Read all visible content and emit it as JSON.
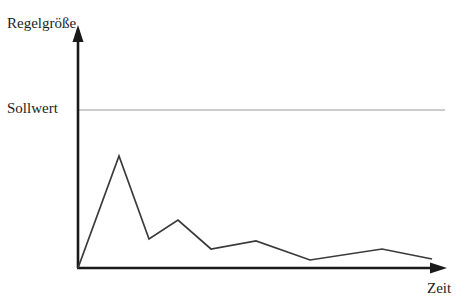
{
  "figure": {
    "title": "",
    "axis_label_y": "Regelgröße",
    "axis_label_x": "Zeit",
    "setpoint_label": "Sollwert",
    "colors": {
      "background": "#ffffff",
      "axis": "#1a1a1a",
      "curve": "#3a3a3a",
      "setpoint_line": "#9a9a9a",
      "text": "#1d1d1d"
    }
  },
  "chart_data": {
    "type": "line",
    "title": "",
    "xlabel": "Zeit",
    "ylabel": "Regelgröße",
    "grid": false,
    "legend": null,
    "axes": {
      "x_arrow": true,
      "y_arrow": true,
      "x_ticks": [],
      "y_ticks": [
        "Sollwert"
      ],
      "origin_px": [
        78,
        268
      ],
      "x_axis_end_px": [
        446,
        268
      ],
      "y_axis_top_px": [
        78,
        27
      ]
    },
    "annotations": [
      {
        "name": "setpoint",
        "label": "Sollwert",
        "type": "horizontal-line",
        "y_px": 110,
        "x_start_px": 78,
        "x_end_px": 445,
        "color": "#9a9a9a"
      }
    ],
    "series": [
      {
        "name": "Regelgröße",
        "color": "#3a3a3a",
        "points_px": [
          [
            78,
            268
          ],
          [
            119,
            156
          ],
          [
            149,
            239
          ],
          [
            178,
            220
          ],
          [
            211,
            249
          ],
          [
            256,
            241
          ],
          [
            310,
            260
          ],
          [
            382,
            249
          ],
          [
            432,
            259
          ]
        ],
        "x": [
          0,
          1,
          2,
          3,
          4,
          5,
          6,
          7,
          8
        ],
        "values": [
          0,
          71,
          18,
          30,
          12,
          17,
          5,
          12,
          6
        ],
        "description": "Gedämpfte Schwingung der Regelgröße, die den Sollwert nicht erreicht"
      }
    ],
    "ylim": [
      0,
      100
    ],
    "xlim": [
      0,
      8.9
    ]
  }
}
